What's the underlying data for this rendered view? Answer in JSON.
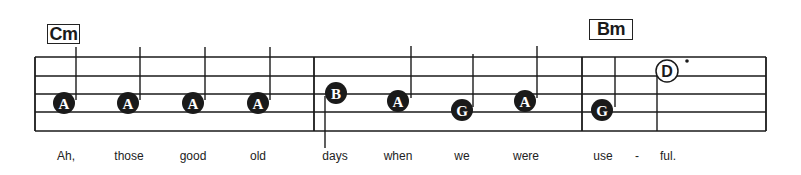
{
  "staff": {
    "left_x": 35,
    "right_x": 766,
    "line_y": [
      57,
      76,
      94,
      112,
      131
    ],
    "barlines_x": [
      314,
      582
    ]
  },
  "chords": [
    {
      "label": "Cm",
      "x": 47,
      "y": 24,
      "w": 33,
      "h": 20
    },
    {
      "label": "Bm",
      "x": 589,
      "y": 19,
      "w": 44,
      "h": 21
    }
  ],
  "notes": [
    {
      "name": "A",
      "x": 64,
      "y": 103,
      "filled": true,
      "stem_x": 76,
      "stem_top": 47,
      "stem_bottom": 100
    },
    {
      "name": "A",
      "x": 128,
      "y": 103,
      "filled": true,
      "stem_x": 140,
      "stem_top": 47,
      "stem_bottom": 100
    },
    {
      "name": "A",
      "x": 193,
      "y": 103,
      "filled": true,
      "stem_x": 205,
      "stem_top": 47,
      "stem_bottom": 100
    },
    {
      "name": "A",
      "x": 258,
      "y": 103,
      "filled": true,
      "stem_x": 270,
      "stem_top": 47,
      "stem_bottom": 100
    },
    {
      "name": "B",
      "x": 336,
      "y": 93,
      "filled": true,
      "stem_x": 325,
      "stem_top": 96,
      "stem_bottom": 148
    },
    {
      "name": "A",
      "x": 398,
      "y": 101,
      "filled": true,
      "stem_x": 411,
      "stem_top": 46,
      "stem_bottom": 98
    },
    {
      "name": "G",
      "x": 462,
      "y": 110,
      "filled": true,
      "stem_x": 473,
      "stem_top": 54,
      "stem_bottom": 107
    },
    {
      "name": "A",
      "x": 525,
      "y": 101,
      "filled": true,
      "stem_x": 537,
      "stem_top": 46,
      "stem_bottom": 98
    },
    {
      "name": "G",
      "x": 602,
      "y": 110,
      "filled": true,
      "stem_x": 615,
      "stem_top": 57,
      "stem_bottom": 107
    },
    {
      "name": "D",
      "x": 667,
      "y": 71,
      "filled": false,
      "stem_x": 657,
      "stem_top": 74,
      "stem_bottom": 131,
      "dotted": true,
      "dot_x": 687,
      "dot_y": 61
    }
  ],
  "lyrics": [
    {
      "text": "Ah,",
      "x": 66
    },
    {
      "text": "those",
      "x": 129
    },
    {
      "text": "good",
      "x": 193
    },
    {
      "text": "old",
      "x": 258
    },
    {
      "text": "days",
      "x": 335
    },
    {
      "text": "when",
      "x": 398
    },
    {
      "text": "we",
      "x": 462
    },
    {
      "text": "were",
      "x": 526
    },
    {
      "text": "use",
      "x": 603
    },
    {
      "text": "-",
      "x": 637
    },
    {
      "text": "ful.",
      "x": 668
    }
  ],
  "colors": {
    "ink": "#1a1a1a",
    "paper": "#ffffff"
  }
}
